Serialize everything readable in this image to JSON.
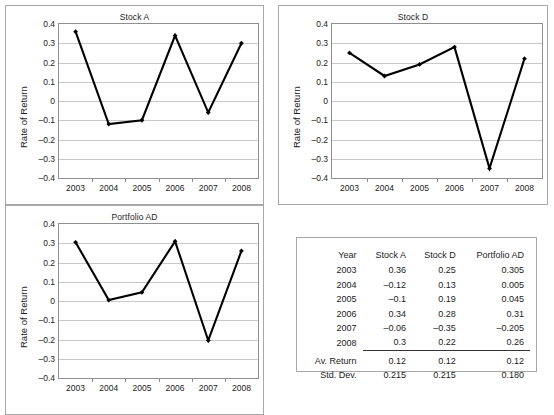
{
  "charts": [
    {
      "id": "stock-a",
      "title": "Stock A",
      "ylabel": "Rate of Return",
      "yticks": [
        "0.4",
        "0.3",
        "0.2",
        "0.1",
        "0",
        "–0.1",
        "–0.2",
        "–0.3",
        "–0.4"
      ],
      "xticks": [
        "2003",
        "2004",
        "2005",
        "2006",
        "2007",
        "2008"
      ],
      "values": [
        0.36,
        -0.12,
        -0.1,
        0.34,
        -0.06,
        0.3
      ]
    },
    {
      "id": "stock-d",
      "title": "Stock D",
      "ylabel": "Rate of Return",
      "yticks": [
        "0.4",
        "0.3",
        "0.2",
        "0.1",
        "0",
        "–0.1",
        "–0.2",
        "–0.3",
        "–0.4"
      ],
      "xticks": [
        "2003",
        "2004",
        "2005",
        "2006",
        "2007",
        "2008"
      ],
      "values": [
        0.25,
        0.13,
        0.19,
        0.28,
        -0.35,
        0.22
      ]
    },
    {
      "id": "portfolio-ad",
      "title": "Portfolio AD",
      "ylabel": "Rate of Return",
      "yticks": [
        "0.4",
        "0.3",
        "0.2",
        "0.1",
        "0",
        "–0.1",
        "–0.2",
        "–0.3",
        "–0.4"
      ],
      "xticks": [
        "2003",
        "2004",
        "2005",
        "2006",
        "2007",
        "2008"
      ],
      "values": [
        0.305,
        0.005,
        0.045,
        0.31,
        -0.205,
        0.26
      ]
    }
  ],
  "chart_data": [
    {
      "type": "line",
      "title": "Stock A",
      "xlabel": "",
      "ylabel": "Rate of Return",
      "categories": [
        "2003",
        "2004",
        "2005",
        "2006",
        "2007",
        "2008"
      ],
      "values": [
        0.36,
        -0.12,
        -0.1,
        0.34,
        -0.06,
        0.3
      ],
      "ylim": [
        -0.4,
        0.4
      ],
      "yticks": [
        0.4,
        0.3,
        0.2,
        0.1,
        0,
        -0.1,
        -0.2,
        -0.3,
        -0.4
      ],
      "grid": true,
      "legend": "none",
      "marker": "diamond",
      "line_color": "#000000"
    },
    {
      "type": "line",
      "title": "Stock D",
      "xlabel": "",
      "ylabel": "Rate of Return",
      "categories": [
        "2003",
        "2004",
        "2005",
        "2006",
        "2007",
        "2008"
      ],
      "values": [
        0.25,
        0.13,
        0.19,
        0.28,
        -0.35,
        0.22
      ],
      "ylim": [
        -0.4,
        0.4
      ],
      "yticks": [
        0.4,
        0.3,
        0.2,
        0.1,
        0,
        -0.1,
        -0.2,
        -0.3,
        -0.4
      ],
      "grid": true,
      "legend": "none",
      "marker": "diamond",
      "line_color": "#000000"
    },
    {
      "type": "line",
      "title": "Portfolio AD",
      "xlabel": "",
      "ylabel": "Rate of Return",
      "categories": [
        "2003",
        "2004",
        "2005",
        "2006",
        "2007",
        "2008"
      ],
      "values": [
        0.305,
        0.005,
        0.045,
        0.31,
        -0.205,
        0.26
      ],
      "ylim": [
        -0.4,
        0.4
      ],
      "yticks": [
        0.4,
        0.3,
        0.2,
        0.1,
        0,
        -0.1,
        -0.2,
        -0.3,
        -0.4
      ],
      "grid": true,
      "legend": "none",
      "marker": "diamond",
      "line_color": "#000000"
    },
    {
      "type": "table",
      "title": "",
      "columns": [
        "Year",
        "Stock A",
        "Stock D",
        "Portfolio AD"
      ],
      "rows": [
        [
          "2003",
          "0.36",
          "0.25",
          "0.305"
        ],
        [
          "2004",
          "–0.12",
          "0.13",
          "0.005"
        ],
        [
          "2005",
          "–0.1",
          "0.19",
          "0.045"
        ],
        [
          "2006",
          "0.34",
          "0.28",
          "0.31"
        ],
        [
          "2007",
          "–0.06",
          "–0.35",
          "–0.205"
        ],
        [
          "2008",
          "0.3",
          "0.22",
          "0.26"
        ],
        [
          "Av. Return",
          "0.12",
          "0.12",
          "0.12"
        ],
        [
          "Std. Dev.",
          "0.215",
          "0.215",
          "0.180"
        ]
      ]
    }
  ],
  "table": {
    "headers": [
      "Year",
      "Stock A",
      "Stock D",
      "Portfolio AD"
    ],
    "rows": [
      {
        "label": "2003",
        "a": "0.36",
        "d": "0.25",
        "p": "0.305"
      },
      {
        "label": "2004",
        "a": "–0.12",
        "d": "0.13",
        "p": "0.005"
      },
      {
        "label": "2005",
        "a": "–0.1",
        "d": "0.19",
        "p": "0.045"
      },
      {
        "label": "2006",
        "a": "0.34",
        "d": "0.28",
        "p": "0.31"
      },
      {
        "label": "2007",
        "a": "–0.06",
        "d": "–0.35",
        "p": "–0.205"
      },
      {
        "label": "2008",
        "a": "0.3",
        "d": "0.22",
        "p": "0.26"
      }
    ],
    "summary": [
      {
        "label": "Av. Return",
        "a": "0.12",
        "d": "0.12",
        "p": "0.12"
      },
      {
        "label": "Std. Dev.",
        "a": "0.215",
        "d": "0.215",
        "p": "0.180"
      }
    ]
  },
  "colors": {
    "line": "#000000",
    "grid": "#c9c9c9",
    "axis": "#8f8f8f",
    "panel_border": "#a8a8a8",
    "text": "#1a1a1a"
  }
}
